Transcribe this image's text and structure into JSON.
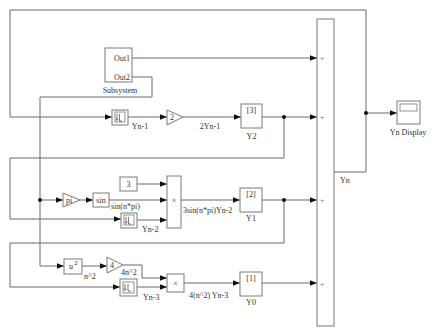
{
  "colors": {
    "wire": "#6a6a6a",
    "block_border": "#7a7a7a",
    "text": "#333333",
    "branch_dot": "#111111"
  },
  "subsystem": {
    "label": "Subsystem",
    "ports": [
      "Out1",
      "Out2"
    ]
  },
  "row_top": {
    "delay": {
      "icon": "unit-delay-icon",
      "output_label": "Yn-1"
    },
    "gain": {
      "value": "2",
      "output_label": "2Yn-1"
    },
    "goto": {
      "tag": "[3]",
      "label": "Y2"
    }
  },
  "row_mid": {
    "gain_pi": {
      "value": "pi"
    },
    "sin": {
      "function": "sin",
      "output_label": "sin(n*pi)"
    },
    "constant": {
      "value": "3"
    },
    "delay": {
      "icon": "unit-delay-icon",
      "output_label": "Yn-2"
    },
    "product": {
      "symbol": "×",
      "output_label": "3sin(n*pi)Yn-2"
    },
    "goto": {
      "tag": "[2]",
      "label": "Y1"
    }
  },
  "row_bottom": {
    "square": {
      "base": "u",
      "exponent": "2",
      "output_label": "n^2"
    },
    "gain": {
      "value": "4",
      "output_label": "4n^2"
    },
    "delay": {
      "icon": "unit-delay-icon",
      "output_label": "Yn-3"
    },
    "product": {
      "symbol": "×",
      "output_label": "4(n^2) Yn-3"
    },
    "goto": {
      "tag": "[1]",
      "label": "Y0"
    }
  },
  "sum": {
    "signs": [
      "+",
      "+",
      "+",
      "+"
    ],
    "output_label": "Yn"
  },
  "display": {
    "label": "Yn Display",
    "icon": "display-icon"
  }
}
